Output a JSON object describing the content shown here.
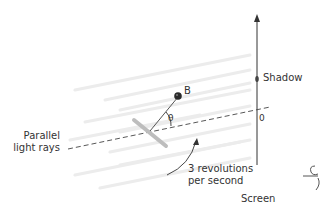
{
  "diagram": {
    "labels": {
      "parallel_light_rays_line1": "Parallel",
      "parallel_light_rays_line2": "light rays",
      "ball": "B",
      "angle": "θ",
      "shadow": "Shadow",
      "origin": "0",
      "revolutions_line1": "3 revolutions",
      "revolutions_line2": "per second",
      "screen": "Screen"
    },
    "colors": {
      "ink": "#333333",
      "rod": "#555555",
      "rays": "#ececec",
      "disk": "#bdbdbd",
      "ball": "#2a2a2a"
    },
    "elements": {
      "screen_axis": "vertical arrow at x≈257 from y≈165 up to y≈15",
      "dashed_axis": "dashed line from left (≈68,148) to screen (≈257,110)",
      "shadow_dot_position": [
        257,
        79
      ],
      "ball_position": [
        178,
        96
      ],
      "pivot_position": [
        150,
        128
      ]
    }
  }
}
